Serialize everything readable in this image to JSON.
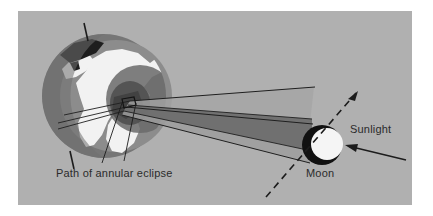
{
  "figure": {
    "kind": "annular-solar-eclipse-diagram",
    "background_color": "#ffffff",
    "panel_color": "#b0b0b0",
    "panel": {
      "left": 18,
      "top": 11,
      "width": 394,
      "height": 194
    }
  },
  "labels": {
    "path_of_annular_eclipse": "Path of annular eclipse",
    "moon": "Moon",
    "sunlight": "Sunlight"
  },
  "colors": {
    "panel_background": "#b0b0b0",
    "earth_ocean": "#8c8c8c",
    "earth_land": "#f2f2f2",
    "earth_night_limb": "#767676",
    "earth_dark_patch": "#1e1e1e",
    "penumbra": "#9a9a9a",
    "umbra": "#6e6e6e",
    "moon_lit": "#f5f5f5",
    "moon_shadow": "#121212",
    "line": "#222222",
    "text": "#2b2b2b"
  },
  "elements": {
    "earth": {
      "name": "Earth",
      "center": {
        "cx": 86,
        "cy": 85
      },
      "radius": 62,
      "axis_tilt_degrees": 12,
      "has_polar_axis_ticks": true
    },
    "moon": {
      "name": "Moon",
      "center": {
        "cx": 304,
        "cy": 134
      },
      "radius": 20,
      "lit_side": "right",
      "shadow_side": "left"
    },
    "shadow_cone": {
      "name": "antumbra-shadow-cone",
      "apex_at": "Earth surface",
      "base_at": "Moon",
      "bands": [
        "penumbra",
        "umbra"
      ]
    },
    "moon_orbit": {
      "name": "moon-orbital-path",
      "style": "dashed",
      "arrow_direction": "up-right"
    },
    "sunlight_arrow": {
      "name": "sunlight-direction-arrow",
      "direction": "right-to-left"
    },
    "eclipse_path_marker": {
      "name": "annular-eclipse-path-box",
      "shape": "small-quadrilateral-on-earth-surface"
    }
  }
}
